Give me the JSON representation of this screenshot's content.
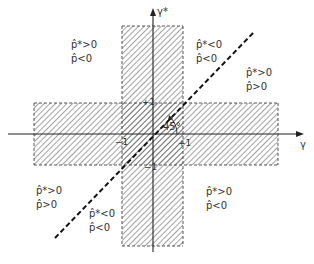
{
  "diagram": {
    "axes": {
      "x_label": "γ",
      "y_label": "γ*"
    },
    "ticks": {
      "x_pos": "+1",
      "x_neg": "−1",
      "y_pos": "+1",
      "y_neg": "−1"
    },
    "angle_label": "45°",
    "regions": [
      {
        "id": "upper-left",
        "line1": "p̂*>0",
        "line2": "p̂<0"
      },
      {
        "id": "upper-middle",
        "line1": "p̂*<0",
        "line2": "p̂<0"
      },
      {
        "id": "right",
        "line1": "p̂*>0",
        "line2": "p̂>0"
      },
      {
        "id": "lower-left",
        "line1": "p̂*>0",
        "line2": "p̂>0"
      },
      {
        "id": "lower-middle",
        "line1": "p̂*<0",
        "line2": "p̂<0"
      },
      {
        "id": "lower-right",
        "line1": "p̂*>0",
        "line2": "p̂<0"
      }
    ],
    "colors": {
      "ink": "#222222",
      "hatch": "#555555",
      "background": "#ffffff"
    }
  }
}
